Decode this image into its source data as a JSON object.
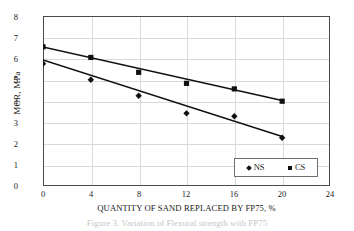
{
  "chart_data": {
    "type": "scatter",
    "title": "",
    "xlabel": "QUANTITY OF SAND REPLACED BY FP75, %",
    "ylabel": "MOR, MPa",
    "xlim": [
      0,
      24
    ],
    "ylim": [
      0,
      8
    ],
    "xticks": [
      0,
      4,
      8,
      12,
      16,
      20,
      24
    ],
    "yticks": [
      0,
      1,
      2,
      3,
      4,
      5,
      6,
      7,
      8
    ],
    "xtick_labels": [
      "0",
      "4",
      "8",
      "12",
      "16",
      "20",
      "24"
    ],
    "ytick_labels": [
      "0",
      "1",
      "2",
      "3",
      "4",
      "5",
      "6",
      "7",
      "8"
    ],
    "grid": true,
    "legend_position": "lower right",
    "x": [
      0,
      4,
      8,
      12,
      16,
      20
    ],
    "series": [
      {
        "name": "NS",
        "marker": "diamond",
        "color": "#111111",
        "values": [
          5.75,
          5.0,
          4.25,
          3.42,
          3.28,
          2.27
        ],
        "trendline": {
          "x": [
            0,
            20
          ],
          "y": [
            5.93,
            2.33
          ]
        }
      },
      {
        "name": "CS",
        "marker": "square",
        "color": "#111111",
        "values": [
          6.55,
          6.05,
          5.35,
          4.83,
          4.57,
          3.99
        ],
        "trendline": {
          "x": [
            0,
            20
          ],
          "y": [
            6.54,
            4.02
          ]
        }
      }
    ]
  },
  "legend": {
    "items": [
      {
        "label": "NS",
        "marker": "diamond"
      },
      {
        "label": "CS",
        "marker": "square"
      }
    ]
  },
  "caption": {
    "text": "Figure 3.  Variation of Flexural strength with FP75"
  }
}
